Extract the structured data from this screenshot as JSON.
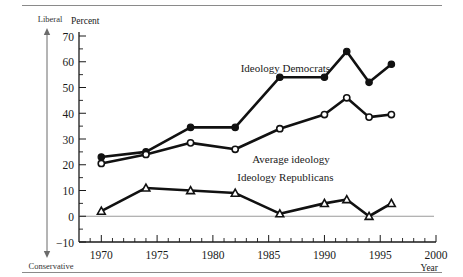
{
  "figure": {
    "axis_direction_top": "Liberal",
    "axis_direction_bottom": "Conservative",
    "y_axis_title": "Percent",
    "x_axis_title": "Year"
  },
  "chart_data": {
    "type": "line",
    "title": "",
    "xlabel": "Year",
    "ylabel": "Percent",
    "xlim": [
      1968,
      2000
    ],
    "ylim": [
      -10,
      70
    ],
    "x_ticks": [
      1970,
      1975,
      1980,
      1985,
      1990,
      1995,
      2000
    ],
    "y_ticks": [
      -10,
      0,
      10,
      20,
      30,
      40,
      50,
      60,
      70
    ],
    "x_minor_tick_step": 1,
    "y_minor_tick_step": 5,
    "grid": false,
    "zero_line": true,
    "legend": "inline-annotations",
    "annotations": [
      {
        "text": "Ideology Democrats",
        "x": 1986.5,
        "y": 56
      },
      {
        "text": "Average ideology",
        "x": 1987.0,
        "y": 20.5
      },
      {
        "text": "Ideology Republicans",
        "x": 1986.5,
        "y": 13.5
      }
    ],
    "series": [
      {
        "name": "Ideology Democrats",
        "marker": "filled-circle",
        "x": [
          1970,
          1974,
          1978,
          1982,
          1986,
          1990,
          1992,
          1994,
          1996
        ],
        "values": [
          23,
          25,
          34.5,
          34.5,
          54,
          54,
          64,
          52,
          59
        ]
      },
      {
        "name": "Average ideology",
        "marker": "open-circle",
        "x": [
          1970,
          1974,
          1978,
          1982,
          1986,
          1990,
          1992,
          1994,
          1996
        ],
        "values": [
          20.5,
          24,
          28.5,
          26,
          34,
          39.5,
          46,
          38.5,
          39.5
        ]
      },
      {
        "name": "Ideology Republicans",
        "marker": "open-triangle",
        "x": [
          1970,
          1974,
          1978,
          1982,
          1986,
          1990,
          1992,
          1994,
          1996
        ],
        "values": [
          2,
          11,
          10,
          9,
          1,
          5,
          6.5,
          0,
          5
        ]
      }
    ]
  }
}
